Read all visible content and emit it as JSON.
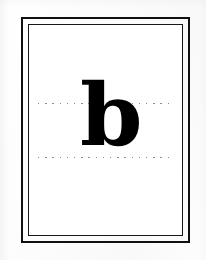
{
  "card": {
    "kind": "letter-flashcard",
    "letter": "b",
    "letter_case": "lowercase",
    "letter_style": "bold serif",
    "background_color": "#ffffff",
    "ink_color": "#080808"
  },
  "frame": {
    "outer": {
      "color": "#101010",
      "thickness_px": 2,
      "x": 21,
      "y": 17,
      "width": 169,
      "height": 226
    },
    "inner": {
      "color": "#171717",
      "thickness_px": 1.5,
      "x": 28,
      "y": 24,
      "width": 155,
      "height": 212
    }
  },
  "guides": {
    "color": "#8d8d8d",
    "style": "dotted",
    "lines": [
      {
        "name": "x-height-line",
        "y": 103,
        "x_start": 38,
        "x_end": 169
      },
      {
        "name": "baseline",
        "y": 157,
        "x_start": 38,
        "x_end": 169
      }
    ]
  },
  "glyph": {
    "character": "b",
    "top_y": 97,
    "baseline_y": 159,
    "center_x": 104
  }
}
